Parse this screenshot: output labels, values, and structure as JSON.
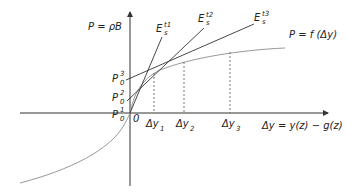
{
  "labels": {
    "y_axis": "P = ρB",
    "curve": "P = f (Δy)",
    "x_axis": "Δy = y(z) − g(z)",
    "origin": "0",
    "p0": [
      {
        "base": "P",
        "sup": "1",
        "sub": "0"
      },
      {
        "base": "P",
        "sup": "2",
        "sub": "0"
      },
      {
        "base": "P",
        "sup": "3",
        "sub": "0"
      }
    ],
    "tangents": [
      {
        "base": "E",
        "sup": "t1",
        "sub": "s"
      },
      {
        "base": "E",
        "sup": "t2",
        "sub": "s"
      },
      {
        "base": "E",
        "sup": "t3",
        "sub": "s"
      }
    ],
    "dy": [
      {
        "base": "Δy",
        "sub": "1"
      },
      {
        "base": "Δy",
        "sub": "2"
      },
      {
        "base": "Δy",
        "sub": "3"
      }
    ]
  },
  "colors": {
    "axis": "#333333",
    "curve": "#999999",
    "line": "#333333"
  }
}
